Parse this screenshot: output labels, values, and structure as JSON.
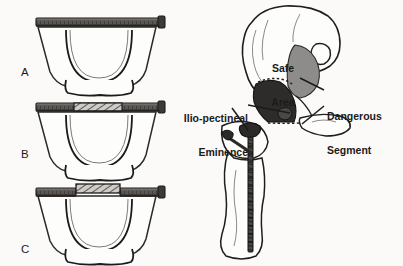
{
  "figure": {
    "kind": "anatomical-illustration",
    "background_color": "#fbfaf8",
    "ink_color": "#1b1b1b"
  },
  "palette": {
    "ink": "#1b1b1b",
    "outline": "#2a2a2a",
    "bone_fill": "#fdfdfb",
    "plate_dark": "#3c3a38",
    "plate_mid": "#6e6a66",
    "plate_light": "#a9a5a1",
    "safe_area_fill": "#8e8c8a",
    "dangerous_fill": "#2e2c2b",
    "screw_fill": "#2b2a29",
    "hatch": "#4a4846"
  },
  "panels": [
    {
      "id": "A",
      "letter": "A",
      "caption": "Straight plate spanning the acetabular rim",
      "plate_style": "straight",
      "letter_pos": {
        "x": 21,
        "y": 66
      }
    },
    {
      "id": "B",
      "letter": "B",
      "caption": "Plate with hatched central contour segment",
      "plate_style": "hatched-center",
      "letter_pos": {
        "x": 21,
        "y": 148
      }
    },
    {
      "id": "C",
      "letter": "C",
      "caption": "Plate with raised, bent central segment",
      "plate_style": "raised-center",
      "letter_pos": {
        "x": 21,
        "y": 243
      }
    }
  ],
  "annotations": [
    {
      "id": "safe-area",
      "text": "Safe\nArea",
      "line1": "Safe",
      "line2": "Area",
      "align": "center",
      "pos": {
        "x": 261,
        "y": 40
      },
      "region_color": "#8e8c8a"
    },
    {
      "id": "ilio-pectineal-eminence",
      "text": "Ilio-pectineal\nEminence",
      "line1": "Ilio-pectineal",
      "line2": "Eminence",
      "align": "right",
      "pos": {
        "x": 168,
        "y": 90
      },
      "leader": true
    },
    {
      "id": "dangerous-segment",
      "text": "Dangerous\nSegment",
      "line1": "Dangerous",
      "line2": "Segment",
      "align": "left",
      "pos": {
        "x": 327,
        "y": 88
      },
      "region_color": "#2e2c2b",
      "leader": true
    }
  ],
  "hardware": {
    "plate_label": "reconstruction-plate",
    "screw_label": "cortical-screw",
    "screw_count_visible": 1
  }
}
